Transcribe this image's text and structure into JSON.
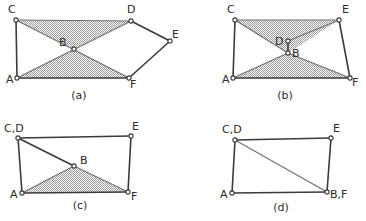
{
  "figure": {
    "background_color": "#ffffff",
    "line_color": "#3a3a3a",
    "thin_line_color": "#6e6e6e",
    "shade_color": "#a8a8a8",
    "joint_fill": "#ffffff",
    "label_color": "#2b2b2b"
  },
  "panels": [
    {
      "id": "a",
      "caption": "(a)",
      "caption_pos": {
        "x": 79,
        "y": 99
      },
      "vertices": [
        {
          "name": "A",
          "x": 17,
          "y": 78,
          "label": "A",
          "label_x": 6,
          "label_y": 83
        },
        {
          "name": "B",
          "x": 74,
          "y": 49,
          "label": "B",
          "label_x": 59,
          "label_y": 46
        },
        {
          "name": "C",
          "x": 16,
          "y": 20,
          "label": "C",
          "label_x": 8,
          "label_y": 13
        },
        {
          "name": "D",
          "x": 131,
          "y": 21,
          "label": "D",
          "label_x": 127,
          "label_y": 13
        },
        {
          "name": "E",
          "x": 170,
          "y": 41,
          "label": "E",
          "label_x": 172,
          "label_y": 38
        },
        {
          "name": "F",
          "x": 129,
          "y": 78,
          "label": "F",
          "label_x": 130,
          "label_y": 88
        }
      ],
      "links": [
        {
          "from": "C",
          "to": "A"
        },
        {
          "from": "A",
          "to": "F"
        },
        {
          "from": "D",
          "to": "E"
        },
        {
          "from": "E",
          "to": "F"
        }
      ],
      "thin_links": [
        {
          "from": "C",
          "to": "D"
        },
        {
          "from": "C",
          "to": "F"
        },
        {
          "from": "A",
          "to": "D"
        }
      ],
      "shaded_regions": [
        {
          "points": "C,D,B"
        },
        {
          "points": "A,F,B"
        }
      ]
    },
    {
      "id": "b",
      "caption": "(b)",
      "caption_pos": {
        "x": 285,
        "y": 99
      },
      "vertices": [
        {
          "name": "A",
          "x": 233,
          "y": 78,
          "label": "A",
          "label_x": 222,
          "label_y": 83
        },
        {
          "name": "B",
          "x": 288,
          "y": 53,
          "label": "B",
          "label_x": 292,
          "label_y": 57
        },
        {
          "name": "C",
          "x": 235,
          "y": 20,
          "label": "C",
          "label_x": 227,
          "label_y": 13
        },
        {
          "name": "D",
          "x": 288,
          "y": 41,
          "label": "D",
          "label_x": 275,
          "label_y": 45
        },
        {
          "name": "E",
          "x": 339,
          "y": 20,
          "label": "E",
          "label_x": 342,
          "label_y": 13
        },
        {
          "name": "F",
          "x": 350,
          "y": 78,
          "label": "F",
          "label_x": 352,
          "label_y": 86
        }
      ],
      "links": [
        {
          "from": "C",
          "to": "A"
        },
        {
          "from": "A",
          "to": "F"
        },
        {
          "from": "E",
          "to": "F"
        },
        {
          "from": "D",
          "to": "B"
        }
      ],
      "thin_links": [
        {
          "from": "C",
          "to": "E"
        },
        {
          "from": "C",
          "to": "B"
        },
        {
          "from": "E",
          "to": "D"
        },
        {
          "from": "A",
          "to": "B"
        },
        {
          "from": "F",
          "to": "B"
        }
      ],
      "shaded_regions": [
        {
          "points": "C,E,B"
        },
        {
          "points": "A,F,B"
        }
      ]
    },
    {
      "id": "c",
      "caption": "(c)",
      "caption_pos": {
        "x": 80,
        "y": 209
      },
      "vertices": [
        {
          "name": "A",
          "x": 22,
          "y": 193,
          "label": "A",
          "label_x": 10,
          "label_y": 198
        },
        {
          "name": "B",
          "x": 74,
          "y": 166,
          "label": "B",
          "label_x": 80,
          "label_y": 164
        },
        {
          "name": "CD",
          "x": 18,
          "y": 138,
          "label": "C,D",
          "label_x": 4,
          "label_y": 132
        },
        {
          "name": "E",
          "x": 131,
          "y": 136,
          "label": "E",
          "label_x": 132,
          "label_y": 130
        },
        {
          "name": "F",
          "x": 128,
          "y": 192,
          "label": "F",
          "label_x": 131,
          "label_y": 200
        }
      ],
      "links": [
        {
          "from": "CD",
          "to": "A"
        },
        {
          "from": "A",
          "to": "F"
        },
        {
          "from": "CD",
          "to": "E"
        },
        {
          "from": "E",
          "to": "F"
        },
        {
          "from": "CD",
          "to": "B"
        }
      ],
      "thin_links": [
        {
          "from": "A",
          "to": "B"
        },
        {
          "from": "B",
          "to": "F"
        }
      ],
      "shaded_regions": [
        {
          "points": "A,F,B"
        }
      ]
    },
    {
      "id": "d",
      "caption": "(d)",
      "caption_pos": {
        "x": 281,
        "y": 211
      },
      "vertices": [
        {
          "name": "A",
          "x": 232,
          "y": 193,
          "label": "A",
          "label_x": 220,
          "label_y": 198
        },
        {
          "name": "CD",
          "x": 235,
          "y": 140,
          "label": "C,D",
          "label_x": 222,
          "label_y": 133
        },
        {
          "name": "E",
          "x": 331,
          "y": 138,
          "label": "E",
          "label_x": 333,
          "label_y": 132
        },
        {
          "name": "BF",
          "x": 327,
          "y": 192,
          "label": "B,F",
          "label_x": 330,
          "label_y": 198
        }
      ],
      "links": [
        {
          "from": "CD",
          "to": "A"
        },
        {
          "from": "A",
          "to": "BF"
        },
        {
          "from": "CD",
          "to": "E"
        },
        {
          "from": "E",
          "to": "BF"
        }
      ],
      "thin_links": [
        {
          "from": "CD",
          "to": "BF"
        }
      ],
      "shaded_regions": []
    }
  ]
}
